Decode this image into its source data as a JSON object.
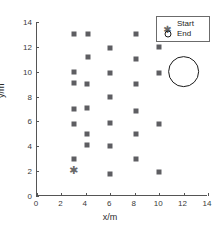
{
  "chart_data": {
    "type": "scatter",
    "title": "",
    "xlabel": "x/m",
    "ylabel": "y/m",
    "xlim": [
      0,
      14
    ],
    "ylim": [
      0,
      14
    ],
    "xticks": [
      0,
      2,
      4,
      6,
      8,
      10,
      12,
      14
    ],
    "yticks": [
      0,
      2,
      4,
      6,
      8,
      10,
      12,
      14
    ],
    "grid": false,
    "legend_position": "upper right",
    "series": [
      {
        "name": "obstacles",
        "marker": "square",
        "color": "#5e5e62",
        "points": [
          [
            3,
            13
          ],
          [
            4.2,
            13
          ],
          [
            8.1,
            13
          ],
          [
            10,
            12
          ],
          [
            6,
            11.9
          ],
          [
            4.2,
            11.2
          ],
          [
            8.1,
            11
          ],
          [
            3,
            10
          ],
          [
            6,
            9.9
          ],
          [
            10,
            9.9
          ],
          [
            3,
            9.1
          ],
          [
            4.1,
            9
          ],
          [
            8.1,
            9
          ],
          [
            6,
            8
          ],
          [
            3,
            7
          ],
          [
            4.1,
            7.1
          ],
          [
            8.1,
            6.8
          ],
          [
            3,
            5.8
          ],
          [
            6,
            5.9
          ],
          [
            10,
            5.8
          ],
          [
            4.1,
            5
          ],
          [
            8.1,
            5
          ],
          [
            4.1,
            4.1
          ],
          [
            6,
            4
          ],
          [
            3,
            3
          ],
          [
            8.1,
            3
          ],
          [
            6,
            1.8
          ],
          [
            10,
            1.9
          ]
        ]
      }
    ],
    "markers": [
      {
        "name": "Start",
        "symbol": "asterisk",
        "color": "#6a6a6a",
        "x": 3,
        "y": 2
      },
      {
        "name": "End",
        "symbol": "circle",
        "color": "#1b1b1b",
        "x": 12,
        "y": 10,
        "radius_m": 1.3
      }
    ],
    "legend": [
      {
        "label": "Start",
        "symbol": "asterisk"
      },
      {
        "label": "End",
        "symbol": "circle"
      }
    ]
  }
}
